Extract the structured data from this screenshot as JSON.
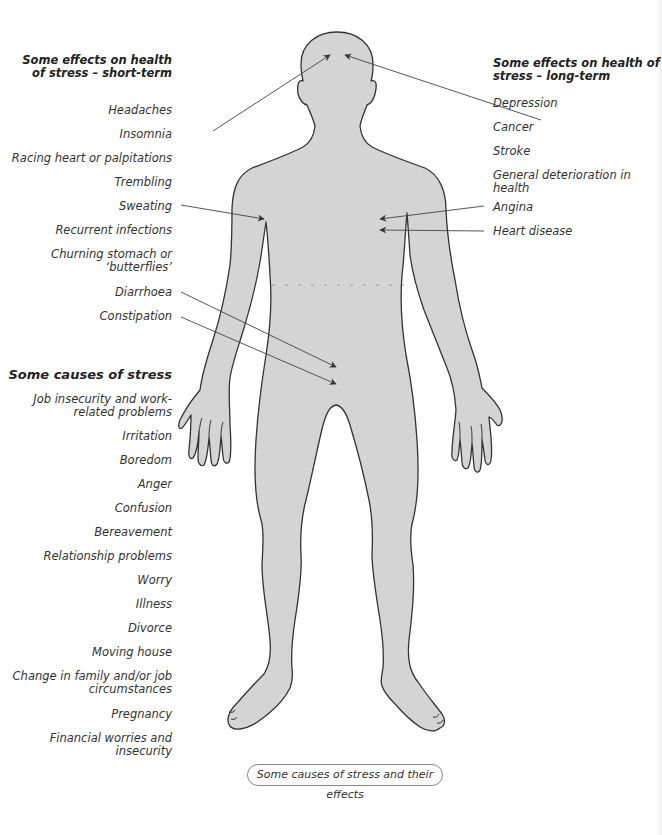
{
  "figure": {
    "caption": "Some causes of stress and their effects",
    "body_fill_color": "#d4d4d4",
    "outline_color": "#333333",
    "arrow_color": "#444444"
  },
  "short_term": {
    "heading_line1": "Some effects on health",
    "heading_line2": "of stress – short-term",
    "items": [
      {
        "line1": "Headaches",
        "arrow_target": "head"
      },
      {
        "line1": "Insomnia"
      },
      {
        "line1": "Racing heart or palpitations"
      },
      {
        "line1": "Trembling"
      },
      {
        "line1": "Sweating",
        "arrow_target": "armpit"
      },
      {
        "line1": "Recurrent infections"
      },
      {
        "line1": "Churning stomach or",
        "line2": "‘butterflies’"
      },
      {
        "line1": "Diarrhoea",
        "arrow_target": "lower abdomen"
      },
      {
        "line1": "Constipation",
        "arrow_target": "lower abdomen"
      }
    ]
  },
  "long_term": {
    "heading_line1": "Some effects on health of",
    "heading_line2": "stress – long-term",
    "items": [
      {
        "line1": "Depression",
        "arrow_target": "head"
      },
      {
        "line1": "Cancer"
      },
      {
        "line1": "Stroke"
      },
      {
        "line1": "General deterioration in",
        "line2": "health"
      },
      {
        "line1": "Angina",
        "arrow_target": "chest"
      },
      {
        "line1": "Heart disease",
        "arrow_target": "chest"
      }
    ]
  },
  "causes": {
    "heading": "Some causes of stress",
    "items": [
      {
        "line1": "Job insecurity and work-",
        "line2": "related problems"
      },
      {
        "line1": "Irritation"
      },
      {
        "line1": "Boredom"
      },
      {
        "line1": "Anger"
      },
      {
        "line1": "Confusion"
      },
      {
        "line1": "Bereavement"
      },
      {
        "line1": "Relationship problems"
      },
      {
        "line1": "Worry"
      },
      {
        "line1": "Illness"
      },
      {
        "line1": "Divorce"
      },
      {
        "line1": "Moving house"
      },
      {
        "line1": "Change in family and/or job",
        "line2": "circumstances"
      },
      {
        "line1": "Pregnancy"
      },
      {
        "line1": "Financial worries and",
        "line2": "insecurity"
      }
    ]
  }
}
